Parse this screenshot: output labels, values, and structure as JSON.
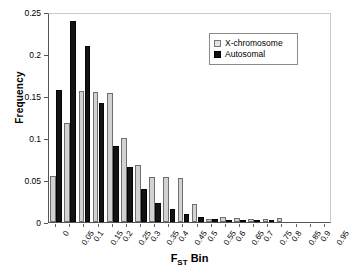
{
  "chart_data": {
    "type": "bar",
    "title": "",
    "xlabel": "FST Bin",
    "xlabel_main": "F",
    "xlabel_sub": "ST",
    "xlabel_tail": " Bin",
    "ylabel": "Frequency",
    "ylim": [
      0,
      0.25
    ],
    "yticks": [
      0,
      0.05,
      0.1,
      0.15,
      0.2,
      0.25
    ],
    "ytick_labels": [
      "0",
      "0.05",
      "0.1",
      "0.15",
      "0.2",
      "0.25"
    ],
    "grid": false,
    "legend_position": "top-right",
    "categories": [
      "0",
      "0.05",
      "0.1",
      "0.15",
      "0.2",
      "0.25",
      "0.3",
      "0.35",
      "0.4",
      "0.45",
      "0.5",
      "0.55",
      "0.6",
      "0.65",
      "0.7",
      "0.75",
      "0.8",
      "0.85",
      "0.9",
      "0.95"
    ],
    "series": [
      {
        "name": "X-chromosome",
        "color": "#d2d2d2",
        "values": [
          0.055,
          0.118,
          0.156,
          0.155,
          0.153,
          0.1,
          0.068,
          0.054,
          0.054,
          0.052,
          0.022,
          0.004,
          0.006,
          0.005,
          0.003,
          0.004,
          0.005,
          0.0,
          0.0,
          0.0
        ]
      },
      {
        "name": "Autosomal",
        "color": "#131313",
        "values": [
          0.157,
          0.239,
          0.21,
          0.142,
          0.09,
          0.066,
          0.039,
          0.023,
          0.015,
          0.009,
          0.006,
          0.003,
          0.002,
          0.002,
          0.001,
          0.002,
          0.0,
          0.0,
          0.0,
          0.0
        ]
      }
    ]
  },
  "legend": {
    "items": [
      {
        "label": "X-chromosome",
        "key": "x-chromosome"
      },
      {
        "label": "Autosomal",
        "key": "autosomal"
      }
    ]
  }
}
